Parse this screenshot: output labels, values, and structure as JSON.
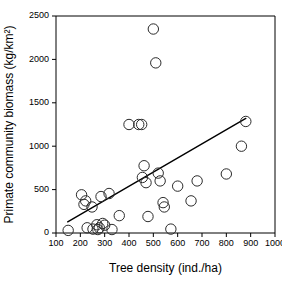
{
  "chart_data": {
    "type": "scatter",
    "title": "",
    "xlabel": "Tree density (ind./ha)",
    "ylabel": "Primate community biomass (kg/km²)",
    "xlim": [
      100,
      1000
    ],
    "ylim": [
      0,
      2500
    ],
    "xticks": [
      100,
      200,
      300,
      400,
      500,
      600,
      700,
      800,
      900,
      1000
    ],
    "yticks": [
      0,
      500,
      1000,
      1500,
      2000,
      2500
    ],
    "xtick_labels": [
      "100",
      "200",
      "300",
      "400",
      "500",
      "600",
      "700",
      "800",
      "900",
      "1000"
    ],
    "ytick_labels": [
      "0",
      "500",
      "1000",
      "1500",
      "2000",
      "2500"
    ],
    "grid": false,
    "legend": null,
    "marker": {
      "shape": "circle-open",
      "edge_color": "#2b2b2b",
      "fill": "none",
      "radius_px": 5.2
    },
    "points": [
      {
        "x": 150,
        "y": 30
      },
      {
        "x": 205,
        "y": 440
      },
      {
        "x": 215,
        "y": 330
      },
      {
        "x": 222,
        "y": 370
      },
      {
        "x": 228,
        "y": 60
      },
      {
        "x": 248,
        "y": 300
      },
      {
        "x": 252,
        "y": 45
      },
      {
        "x": 268,
        "y": 95
      },
      {
        "x": 272,
        "y": 40
      },
      {
        "x": 278,
        "y": 60
      },
      {
        "x": 285,
        "y": 420
      },
      {
        "x": 292,
        "y": 110
      },
      {
        "x": 300,
        "y": 90
      },
      {
        "x": 318,
        "y": 455
      },
      {
        "x": 330,
        "y": 40
      },
      {
        "x": 360,
        "y": 200
      },
      {
        "x": 400,
        "y": 1250
      },
      {
        "x": 440,
        "y": 1250
      },
      {
        "x": 452,
        "y": 1250
      },
      {
        "x": 455,
        "y": 640
      },
      {
        "x": 462,
        "y": 775
      },
      {
        "x": 470,
        "y": 580
      },
      {
        "x": 478,
        "y": 190
      },
      {
        "x": 500,
        "y": 2350
      },
      {
        "x": 510,
        "y": 1960
      },
      {
        "x": 520,
        "y": 690
      },
      {
        "x": 528,
        "y": 600
      },
      {
        "x": 540,
        "y": 350
      },
      {
        "x": 545,
        "y": 300
      },
      {
        "x": 572,
        "y": 45
      },
      {
        "x": 600,
        "y": 540
      },
      {
        "x": 655,
        "y": 370
      },
      {
        "x": 680,
        "y": 600
      },
      {
        "x": 800,
        "y": 680
      },
      {
        "x": 862,
        "y": 1000
      },
      {
        "x": 880,
        "y": 1285
      }
    ],
    "fit_line": {
      "name": "regression-line",
      "x_start": 148,
      "y_start": 128,
      "x_end": 880,
      "y_end": 1320
    }
  }
}
